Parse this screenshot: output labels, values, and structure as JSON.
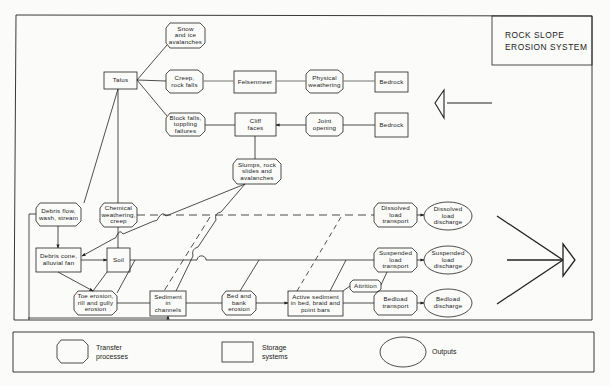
{
  "title": "ROCK SLOPE\nEROSION SYSTEM",
  "nodes": {
    "snow_ice": "Snow\nand ice\navalanches",
    "talus": "Talus",
    "creep_rockfalls": "Creep,\nrock falls",
    "felsenmeer": "Felsenmeer",
    "physical_weathering": "Physical\nweathering",
    "bedrock_top": "Bedrock",
    "block_falls": "Block falls,\ntoppling\nfailures",
    "cliff_faces": "Cliff\nfaces",
    "joint_opening": "Joint\nopening",
    "bedrock_mid": "Bedrock",
    "slumps": "Slumps, rock\nslides and\navalanches",
    "debris_flow": "Debris flow,\nwash, stream",
    "chemical_weathering": "Chemical\nweathering,\ncreep",
    "debris_cone": "Debris cone,\nalluvial fan",
    "soil": "Soil",
    "toe_erosion": "Toe erosion,\nrill and gully\nerosion",
    "sediment_channels": "Sediment\nin\nchannels",
    "bed_bank_erosion": "Bed and\nbank\nerosion",
    "active_sediment": "Active sediment\nin bed, braid and\npoint bars",
    "attrition": "Attrition",
    "dissolved_transport": "Dissolved\nload\ntransport",
    "suspended_transport": "Suspended\nload\ntransport",
    "bedload_transport": "Bedload\ntransport",
    "dissolved_discharge": "Dissolved\nload\ndischarge",
    "suspended_discharge": "Suspended\nload\ndischarge",
    "bedload_discharge": "Bedload\ndischarge"
  },
  "legend": {
    "transfer": "Transfer\nprocesses",
    "storage": "Storage\nsystems",
    "outputs": "Outputs"
  }
}
